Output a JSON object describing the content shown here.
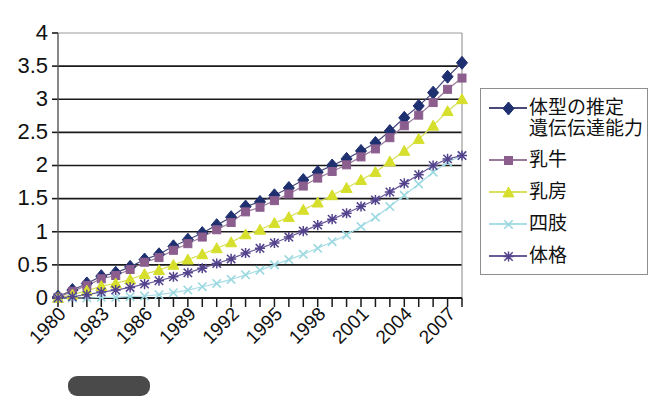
{
  "chart_data": {
    "type": "line",
    "title": "",
    "subtitle": "",
    "xlabel": "",
    "ylabel": "",
    "xlim": [
      1980,
      2008
    ],
    "ylim": [
      0,
      4
    ],
    "ytick_labels": [
      "0",
      "0.5",
      "1",
      "1.5",
      "2",
      "2.5",
      "3",
      "3.5",
      "4"
    ],
    "ytick_values": [
      0,
      0.5,
      1,
      1.5,
      2,
      2.5,
      3,
      3.5,
      4
    ],
    "xtick_labels": [
      "1980",
      "1983",
      "1986",
      "1989",
      "1992",
      "1995",
      "1998",
      "2001",
      "2004",
      "2007"
    ],
    "xtick_values": [
      1980,
      1983,
      1986,
      1989,
      1992,
      1995,
      1998,
      2001,
      2004,
      2007
    ],
    "x": [
      1980,
      1981,
      1982,
      1983,
      1984,
      1985,
      1986,
      1987,
      1988,
      1989,
      1990,
      1991,
      1992,
      1993,
      1994,
      1995,
      1996,
      1997,
      1998,
      1999,
      2000,
      2001,
      2002,
      2003,
      2004,
      2005,
      2006,
      2007,
      2008
    ],
    "grid": "horizontal",
    "legend_position": "right",
    "series": [
      {
        "name": "体型の推定\n遺伝伝達能力",
        "color": "#1F3070",
        "line_color": "#4a4a7a",
        "marker": "diamond",
        "values": [
          0.02,
          0.12,
          0.22,
          0.33,
          0.38,
          0.47,
          0.58,
          0.66,
          0.78,
          0.88,
          0.98,
          1.1,
          1.22,
          1.38,
          1.45,
          1.55,
          1.66,
          1.78,
          1.9,
          2.0,
          2.1,
          2.22,
          2.34,
          2.52,
          2.72,
          2.9,
          3.1,
          3.34,
          3.55
        ]
      },
      {
        "name": "乳牛",
        "color": "#8B5E8E",
        "line_color": "#9a7a9a",
        "marker": "square",
        "values": [
          0.01,
          0.1,
          0.19,
          0.29,
          0.34,
          0.43,
          0.54,
          0.61,
          0.72,
          0.82,
          0.92,
          1.03,
          1.14,
          1.3,
          1.37,
          1.47,
          1.57,
          1.69,
          1.81,
          1.91,
          2.01,
          2.13,
          2.25,
          2.42,
          2.6,
          2.76,
          2.95,
          3.15,
          3.32
        ]
      },
      {
        "name": "乳房",
        "color": "#D6DF2C",
        "line_color": "#d8e05a",
        "marker": "triangle",
        "values": [
          0.0,
          0.05,
          0.11,
          0.18,
          0.22,
          0.28,
          0.36,
          0.42,
          0.5,
          0.58,
          0.66,
          0.75,
          0.84,
          0.96,
          1.03,
          1.13,
          1.22,
          1.33,
          1.44,
          1.55,
          1.66,
          1.78,
          1.9,
          2.06,
          2.22,
          2.4,
          2.6,
          2.82,
          3.0
        ]
      },
      {
        "name": "四肢",
        "color": "#9BD8E0",
        "line_color": "#a8dde6",
        "marker": "x",
        "values": [
          0.0,
          0.0,
          0.0,
          0.01,
          0.01,
          0.02,
          0.03,
          0.05,
          0.08,
          0.12,
          0.17,
          0.22,
          0.28,
          0.35,
          0.42,
          0.5,
          0.58,
          0.66,
          0.75,
          0.85,
          0.95,
          1.08,
          1.22,
          1.38,
          1.55,
          1.72,
          1.9,
          2.05,
          2.15
        ]
      },
      {
        "name": "体格",
        "color": "#53428C",
        "line_color": "#6b5a9a",
        "marker": "star",
        "values": [
          0.0,
          0.02,
          0.05,
          0.09,
          0.12,
          0.16,
          0.21,
          0.26,
          0.32,
          0.38,
          0.45,
          0.52,
          0.59,
          0.68,
          0.75,
          0.83,
          0.92,
          1.01,
          1.1,
          1.19,
          1.28,
          1.38,
          1.48,
          1.6,
          1.73,
          1.86,
          2.0,
          2.1,
          2.15
        ]
      }
    ]
  },
  "legend": {
    "items": [
      {
        "label": "体型の推定\n遺伝伝達能力"
      },
      {
        "label": "乳牛"
      },
      {
        "label": "乳房"
      },
      {
        "label": "四肢"
      },
      {
        "label": "体格"
      }
    ]
  },
  "bottom_strip": {
    "pill_label": "",
    "ghost_text": ""
  }
}
